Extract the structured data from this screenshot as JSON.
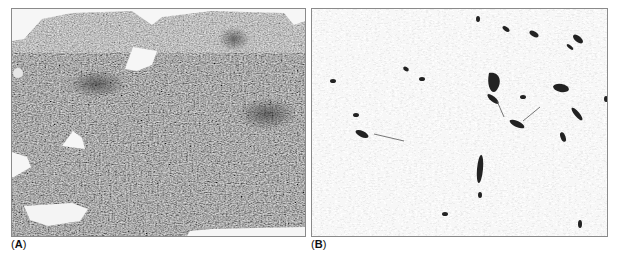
{
  "figure": {
    "panels": [
      {
        "id": "A",
        "label_prefix": "(",
        "label_letter": "A",
        "label_suffix": ")",
        "description": "Low-power histology micrograph of densely cellular spindle cell tissue (H&E-like, grayscale) with irregular white empty spaces",
        "colors": {
          "tissue_base": "#6b6b6b",
          "tissue_dark": "#3a3a3a",
          "tissue_light": "#9a9a9a",
          "space": "#f4f4f4"
        }
      },
      {
        "id": "B",
        "label_prefix": "(",
        "label_letter": "B",
        "label_suffix": ")",
        "description": "Immunostained section: pale gray spindle nuclei background with scattered dark positively stained cells",
        "colors": {
          "background": "#eeeeee",
          "nuclei": "#c4c4c4",
          "positive_cells": "#222222"
        }
      }
    ]
  }
}
